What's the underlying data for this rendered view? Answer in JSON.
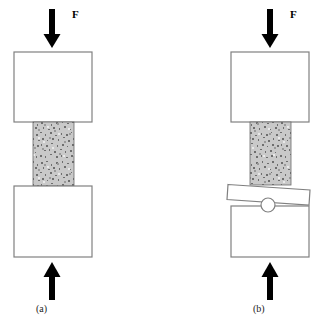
{
  "figure": {
    "background_color": "#ffffff",
    "outline_color": "#808080",
    "specimen_fill_color": "#b5b5b5",
    "arrow_color": "#000000",
    "plate_fill_color": "#ffffff",
    "panels": [
      {
        "id": "a",
        "caption": "(a)",
        "force_label": "F",
        "description": "Fixed flat platens compressing a speckled specimen",
        "top_arrow": {
          "name": "top-force-arrow",
          "direction": "down",
          "label": "F",
          "x": 52,
          "y_start": 9,
          "y_end": 48,
          "shaft_width": 6,
          "head_width": 17,
          "head_height": 14
        },
        "top_block": {
          "name": "upper-platen",
          "x": 14,
          "y": 52,
          "width": 78,
          "height": 70
        },
        "specimen": {
          "name": "specimen",
          "x": 33,
          "y": 122,
          "width": 41,
          "height": 64
        },
        "bottom_block": {
          "name": "lower-platen",
          "x": 14,
          "y": 186,
          "width": 78,
          "height": 71
        },
        "bottom_arrow": {
          "name": "bottom-force-arrow",
          "direction": "up",
          "x": 52,
          "y_start": 300,
          "y_end": 262,
          "shaft_width": 6,
          "head_width": 17,
          "head_height": 14
        },
        "caption_pos": {
          "x": 36,
          "y": 312
        }
      },
      {
        "id": "b",
        "caption": "(b)",
        "force_label": "F",
        "description": "Self-aligning spherically seated platen with ball pivot and tilted plate",
        "top_arrow": {
          "name": "top-force-arrow",
          "direction": "down",
          "label": "F",
          "x": 270,
          "y_start": 9,
          "y_end": 48,
          "shaft_width": 6,
          "head_width": 17,
          "head_height": 14
        },
        "top_block": {
          "name": "upper-platen",
          "x": 231,
          "y": 52,
          "width": 78,
          "height": 70
        },
        "specimen": {
          "name": "specimen",
          "x": 250,
          "y": 122,
          "width": 41,
          "height": 63
        },
        "tilted_plate": {
          "name": "tilted-seat-plate",
          "points": "228,185 310,190 309,205 227,200",
          "tilt": "down-to-right"
        },
        "ball": {
          "name": "spherical-seat-ball",
          "cx": 268,
          "cy": 205,
          "r": 7
        },
        "bottom_block": {
          "name": "lower-platen",
          "x": 231,
          "y": 206,
          "width": 78,
          "height": 51
        },
        "bottom_arrow": {
          "name": "bottom-force-arrow",
          "direction": "up",
          "x": 270,
          "y_start": 300,
          "y_end": 262,
          "shaft_width": 6,
          "head_width": 17,
          "head_height": 14
        },
        "caption_pos": {
          "x": 253,
          "y": 312
        }
      }
    ]
  }
}
